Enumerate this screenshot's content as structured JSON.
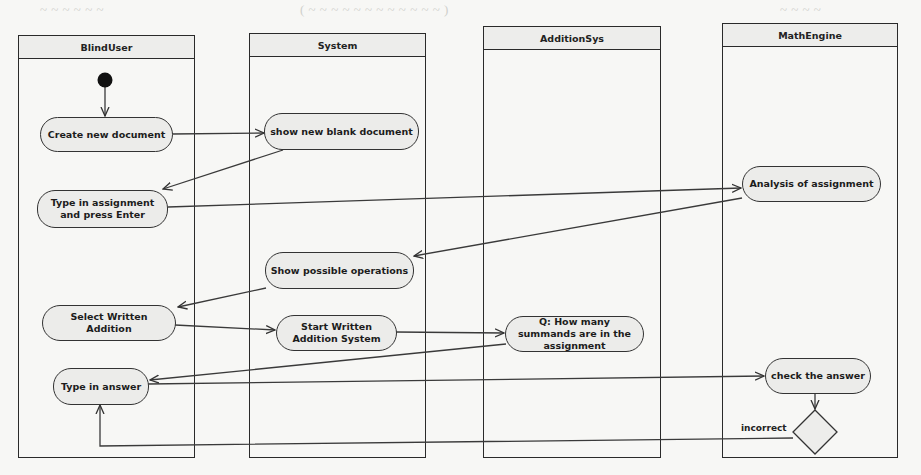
{
  "diagram": {
    "type": "UML activity diagram",
    "lanes": [
      {
        "id": "blinduser",
        "label": "BlindUser"
      },
      {
        "id": "system",
        "label": "System"
      },
      {
        "id": "additionsys",
        "label": "AdditionSys"
      },
      {
        "id": "mathengine",
        "label": "MathEngine"
      }
    ],
    "nodes": {
      "start": {
        "type": "initial",
        "lane": "BlindUser"
      },
      "create_doc": {
        "label": "Create new document",
        "lane": "BlindUser"
      },
      "show_blank": {
        "label": "show new blank document",
        "lane": "System"
      },
      "type_assignment": {
        "label": "Type in assignment and press Enter",
        "lane": "BlindUser"
      },
      "analysis": {
        "label": "Analysis of assignment",
        "lane": "MathEngine"
      },
      "show_ops": {
        "label": "Show possible operations",
        "lane": "System"
      },
      "select_addition": {
        "label": "Select Written Addition",
        "lane": "BlindUser"
      },
      "start_addition": {
        "label": "Start Written Addition System",
        "lane": "System"
      },
      "question": {
        "label": "Q: How many summands are in the assignment",
        "lane": "AdditionSys"
      },
      "type_answer": {
        "label": "Type in answer",
        "lane": "BlindUser"
      },
      "check_answer": {
        "label": "check the answer",
        "lane": "MathEngine"
      },
      "decision": {
        "type": "decision",
        "lane": "MathEngine"
      }
    },
    "edges": [
      {
        "from": "start",
        "to": "create_doc"
      },
      {
        "from": "create_doc",
        "to": "show_blank"
      },
      {
        "from": "show_blank",
        "to": "type_assignment"
      },
      {
        "from": "type_assignment",
        "to": "analysis"
      },
      {
        "from": "analysis",
        "to": "show_ops"
      },
      {
        "from": "show_ops",
        "to": "select_addition"
      },
      {
        "from": "select_addition",
        "to": "start_addition"
      },
      {
        "from": "start_addition",
        "to": "question"
      },
      {
        "from": "question",
        "to": "type_answer"
      },
      {
        "from": "type_answer",
        "to": "check_answer"
      },
      {
        "from": "check_answer",
        "to": "decision"
      },
      {
        "from": "decision",
        "to": "type_answer",
        "guard": "incorrect"
      }
    ]
  },
  "colors": {
    "background": "#f7f7f5",
    "line": "#2a2a2a",
    "node_fill": "#ececea",
    "header_fill": "#ededeb"
  }
}
